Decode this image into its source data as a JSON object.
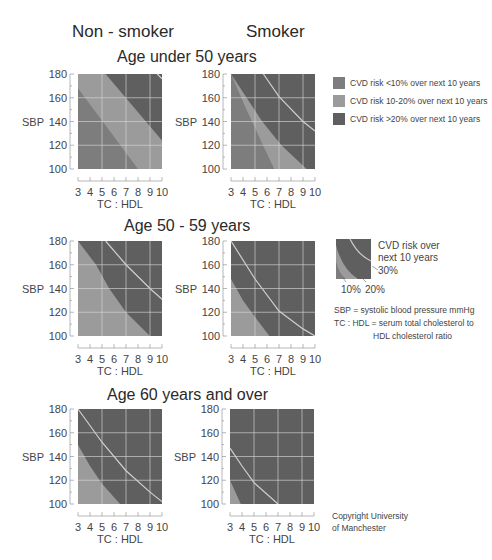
{
  "headers": {
    "non_smoker": "Non - smoker",
    "smoker": "Smoker"
  },
  "rows": [
    {
      "title": "Age under 50 years"
    },
    {
      "title": "Age 50 - 59 years"
    },
    {
      "title": "Age 60 years and over"
    }
  ],
  "colors": {
    "low": "#7d7d7d",
    "mid": "#9b9b9b",
    "high": "#5f5f5f",
    "grid": "#d8d8d8",
    "line30": "#cfcfcf"
  },
  "legend": {
    "items": [
      {
        "label": "CVD risk <10% over next 10 years",
        "color": "#7d7d7d"
      },
      {
        "label": "CVD risk 10-20% over next 10 years",
        "color": "#9b9b9b"
      },
      {
        "label": "CVD risk >20% over next 10 years",
        "color": "#5f5f5f"
      }
    ],
    "mini": {
      "title_line1": "CVD risk over",
      "title_line2": "next 10 years",
      "label_30": "30%",
      "label_10": "10%",
      "label_20": "20%"
    },
    "notes": {
      "sbp": "SBP = systolic blood pressure mmHg",
      "tc_line1": "TC : HDL = serum total cholesterol to",
      "tc_line2": "HDL cholesterol ratio"
    }
  },
  "copyright": {
    "line1": "Copyright University",
    "line2": "of Manchester"
  },
  "axes": {
    "ylabel": "SBP",
    "xlabel": "TC : HDL",
    "yticks": [
      "100",
      "120",
      "140",
      "160",
      "180"
    ],
    "xticks": [
      "3",
      "4",
      "5",
      "6",
      "7",
      "8",
      "9",
      "10"
    ]
  },
  "chart_data": [
    {
      "type": "heatmap",
      "title": "Age under 50 years — Non-smoker",
      "xlabel": "TC : HDL",
      "ylabel": "SBP",
      "xlim": [
        3,
        10
      ],
      "ylim": [
        100,
        180
      ],
      "grid": true,
      "zones": [
        {
          "name": "CVD risk <10%",
          "boundary_to_10_20": [
            [
              3,
              168
            ],
            [
              8,
              100
            ]
          ]
        },
        {
          "name": "CVD risk 10-20%",
          "boundary_to_gt20": [
            [
              5.3,
              180
            ],
            [
              10,
              124
            ]
          ]
        },
        {
          "name": "CVD risk >20%"
        }
      ],
      "line_30pct": [
        [
          9.6,
          180
        ],
        [
          10,
          176
        ]
      ]
    },
    {
      "type": "heatmap",
      "title": "Age under 50 years — Smoker",
      "xlabel": "TC : HDL",
      "ylabel": "SBP",
      "xlim": [
        3,
        10
      ],
      "ylim": [
        100,
        180
      ],
      "grid": true,
      "zones": [
        {
          "name": "CVD risk <10%",
          "boundary_to_10_20": [
            [
              3,
              180
            ],
            [
              4.3,
              150
            ],
            [
              5.4,
              126
            ],
            [
              6.6,
              100
            ]
          ]
        },
        {
          "name": "CVD risk 10-20%",
          "boundary_to_gt20": [
            [
              3,
              180
            ],
            [
              4.3,
              160
            ],
            [
              5.6,
              140
            ],
            [
              7.2,
              120
            ],
            [
              9.3,
              100
            ]
          ]
        },
        {
          "name": "CVD risk >20%"
        }
      ],
      "line_30pct": [
        [
          5.7,
          180
        ],
        [
          7,
          161
        ],
        [
          9,
          140
        ],
        [
          10,
          132
        ]
      ]
    },
    {
      "type": "heatmap",
      "title": "Age 50 - 59 years — Non-smoker",
      "xlabel": "TC : HDL",
      "ylabel": "SBP",
      "xlim": [
        3,
        10
      ],
      "ylim": [
        100,
        180
      ],
      "grid": true,
      "zones": [
        {
          "name": "CVD risk <10%",
          "boundary_to_10_20": []
        },
        {
          "name": "CVD risk 10-20%",
          "boundary_to_gt20": [
            [
              3,
              180
            ],
            [
              4.5,
              160
            ],
            [
              5.6,
              140
            ],
            [
              7,
              120
            ],
            [
              9,
              100
            ]
          ]
        },
        {
          "name": "CVD risk >20%"
        }
      ],
      "line_30pct": [
        [
          5.3,
          180
        ],
        [
          7,
          160
        ],
        [
          9,
          140
        ],
        [
          10,
          131
        ]
      ]
    },
    {
      "type": "heatmap",
      "title": "Age 50 - 59 years — Smoker",
      "xlabel": "TC : HDL",
      "ylabel": "SBP",
      "xlim": [
        3,
        10
      ],
      "ylim": [
        100,
        180
      ],
      "grid": true,
      "zones": [
        {
          "name": "CVD risk 10-20%",
          "boundary_to_gt20": [
            [
              3,
              148
            ],
            [
              4,
              130
            ],
            [
              5,
              116
            ],
            [
              6.2,
              100
            ]
          ]
        },
        {
          "name": "CVD risk >20%"
        }
      ],
      "line_30pct": [
        [
          3,
          180
        ],
        [
          5,
          148
        ],
        [
          7,
          121
        ],
        [
          9,
          106
        ],
        [
          10,
          100
        ]
      ]
    },
    {
      "type": "heatmap",
      "title": "Age 60 years and over — Non-smoker",
      "xlabel": "TC : HDL",
      "ylabel": "SBP",
      "xlim": [
        3,
        10
      ],
      "ylim": [
        100,
        180
      ],
      "grid": true,
      "zones": [
        {
          "name": "CVD risk 10-20%",
          "boundary_to_gt20": [
            [
              3,
              150
            ],
            [
              4,
              132
            ],
            [
              5,
              117
            ],
            [
              6.5,
              100
            ]
          ]
        },
        {
          "name": "CVD risk >20%"
        }
      ],
      "line_30pct": [
        [
          3,
          180
        ],
        [
          5,
          152
        ],
        [
          7,
          128
        ],
        [
          9,
          110
        ],
        [
          10,
          102
        ]
      ]
    },
    {
      "type": "heatmap",
      "title": "Age 60 years and over — Smoker",
      "xlabel": "TC : HDL",
      "ylabel": "SBP",
      "xlim": [
        3,
        10
      ],
      "ylim": [
        100,
        180
      ],
      "grid": true,
      "zones": [
        {
          "name": "CVD risk 10-20%",
          "boundary_to_gt20": [
            [
              3,
              120
            ],
            [
              3.9,
              100
            ]
          ]
        },
        {
          "name": "CVD risk >20%"
        }
      ],
      "line_30pct": [
        [
          3,
          147
        ],
        [
          4,
          132
        ],
        [
          5,
          118
        ],
        [
          7,
          100
        ]
      ]
    }
  ]
}
